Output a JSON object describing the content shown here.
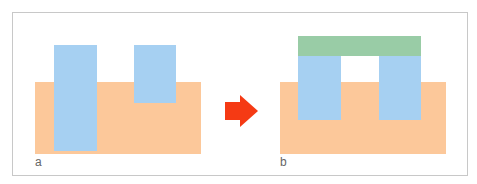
{
  "panels": [
    {
      "label": "a"
    },
    {
      "label": "b"
    }
  ],
  "colors": {
    "substrate": "#fcc89a",
    "pillar": "#a6d0f2",
    "cap": "#99cca6",
    "arrow": "#f53a14",
    "border": "#c8c8c8"
  },
  "arrow": {
    "icon": "right-arrow-icon"
  }
}
